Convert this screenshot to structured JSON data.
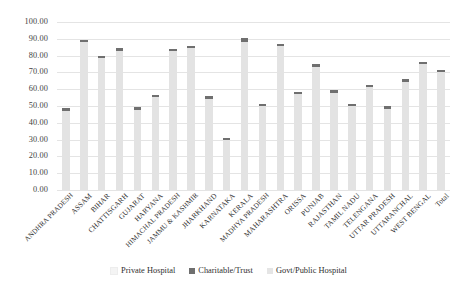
{
  "chart_data": {
    "type": "bar",
    "title": "",
    "xlabel": "",
    "ylabel": "",
    "ylim": [
      0,
      100
    ],
    "ytick_labels": [
      "100.00",
      "90.00",
      "80.00",
      "70.00",
      "60.00",
      "50.00",
      "40.00",
      "30.00",
      "20.00",
      "10.00",
      "0.00"
    ],
    "ytick_values": [
      100,
      90,
      80,
      70,
      60,
      50,
      40,
      30,
      20,
      10,
      0
    ],
    "grid": true,
    "legend_position": "bottom",
    "stacked": true,
    "categories": [
      "ANDHRA PRADESH",
      "ASSAM",
      "BIHAR",
      "CHATTISGARH",
      "GUJARAT",
      "HARYANA",
      "HIMACHAL PRADESH",
      "JAMMU & KASHMIR",
      "JHARKHAND",
      "KARNATAKA",
      "KERALA",
      "MADHYA PRADESH",
      "MAHARASHTRA",
      "ORISSA",
      "PUNJAB",
      "RAJASTHAN",
      "TAMIL NADU",
      "TELENGANA",
      "UTTAR PRADESH",
      "UTTARANCHAL",
      "WEST BENGAL",
      "Total"
    ],
    "series": [
      {
        "name": "Private Hospital",
        "color": "#f4f4f4",
        "values": [
          0,
          0,
          0,
          0,
          0,
          0,
          0,
          0,
          0,
          0,
          0,
          0,
          0,
          0,
          0,
          0,
          0,
          0,
          0,
          0,
          0,
          0
        ]
      },
      {
        "name": "Charitable/Trust",
        "color": "#6f6f6f",
        "values": [
          2.0,
          1.3,
          1.3,
          2.0,
          2.0,
          1.3,
          1.3,
          1.3,
          2.0,
          1.3,
          2.0,
          1.3,
          1.3,
          1.3,
          1.3,
          1.3,
          1.3,
          1.3,
          1.3,
          1.3,
          1.3,
          1.3
        ]
      },
      {
        "name": "Govt/Public Hospital",
        "color": "#e3e3e3",
        "values": [
          47.0,
          88.2,
          78.7,
          82.5,
          47.5,
          55.2,
          82.7,
          84.5,
          54.0,
          29.5,
          88.2,
          50.0,
          85.7,
          57.0,
          73.5,
          58.0,
          50.0,
          61.2,
          48.5,
          64.5,
          75.0,
          70.0
        ]
      }
    ],
    "totals": [
      49.0,
      89.5,
      80.0,
      84.5,
      49.5,
      56.5,
      84.0,
      85.8,
      56.0,
      31.5,
      89.5,
      51.3,
      87.0,
      58.3,
      74.8,
      59.3,
      51.3,
      62.5,
      49.8,
      65.8,
      76.3,
      71.3
    ]
  },
  "legend": {
    "items": [
      {
        "label": "Private Hospital",
        "swatch": "sw-private"
      },
      {
        "label": "Charitable/Trust",
        "swatch": "sw-charitable"
      },
      {
        "label": "Govt/Public Hospital",
        "swatch": "sw-govt"
      }
    ]
  }
}
